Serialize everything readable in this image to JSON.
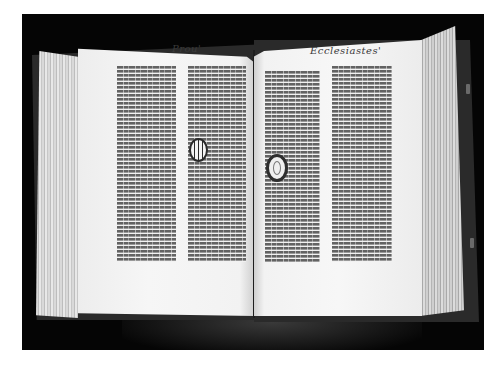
{
  "image": {
    "subject": "Open incunabulum (Gutenberg-style Bible) on black background",
    "background_color": "#050505",
    "page_color": "#f4f4f4",
    "text_color": "#3a3a3a"
  },
  "book": {
    "left_page": {
      "running_head": "Prou'",
      "columns": 2,
      "decorated_initial": "M"
    },
    "right_page": {
      "running_head": "Ecclesiastes'",
      "columns": 2,
      "decorated_initial": "O"
    }
  }
}
